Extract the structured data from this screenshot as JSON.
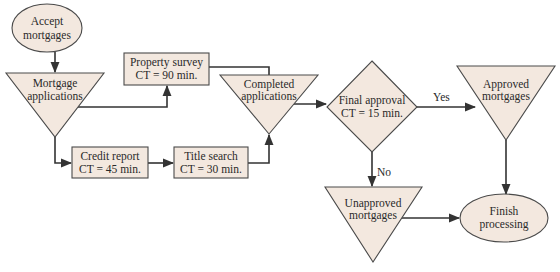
{
  "diagram": {
    "type": "process-flowchart",
    "colors": {
      "node_fill": "#f3e8df",
      "node_stroke": "#4a4a4a",
      "edge": "#333333"
    },
    "nodes": {
      "accept": {
        "shape": "ellipse",
        "line1": "Accept",
        "line2": "mortgages"
      },
      "mortgage_apps": {
        "shape": "inventory-triangle",
        "line1": "Mortgage",
        "line2": "applications"
      },
      "property_survey": {
        "shape": "process-box",
        "line1": "Property survey",
        "line2": "CT = 90 min."
      },
      "credit_report": {
        "shape": "process-box",
        "line1": "Credit report",
        "line2": "CT = 45 min."
      },
      "title_search": {
        "shape": "process-box",
        "line1": "Title search",
        "line2": "CT = 30 min."
      },
      "completed_apps": {
        "shape": "inventory-triangle",
        "line1": "Completed",
        "line2": "applications"
      },
      "final_approval": {
        "shape": "decision-diamond",
        "line1": "Final approval",
        "line2": "CT = 15 min."
      },
      "approved": {
        "shape": "inventory-triangle",
        "line1": "Approved",
        "line2": "mortgages"
      },
      "unapproved": {
        "shape": "inventory-triangle",
        "line1": "Unapproved",
        "line2": "mortgages"
      },
      "finish": {
        "shape": "ellipse",
        "line1": "Finish",
        "line2": "processing"
      }
    },
    "edges": [
      {
        "from": "accept",
        "to": "mortgage_apps",
        "label": ""
      },
      {
        "from": "mortgage_apps",
        "to": "property_survey",
        "label": ""
      },
      {
        "from": "mortgage_apps",
        "to": "credit_report",
        "label": ""
      },
      {
        "from": "credit_report",
        "to": "title_search",
        "label": ""
      },
      {
        "from": "title_search",
        "to": "completed_apps",
        "label": ""
      },
      {
        "from": "property_survey",
        "to": "completed_apps",
        "label": ""
      },
      {
        "from": "completed_apps",
        "to": "final_approval",
        "label": ""
      },
      {
        "from": "final_approval",
        "to": "approved",
        "label": "Yes"
      },
      {
        "from": "final_approval",
        "to": "unapproved",
        "label": "No"
      },
      {
        "from": "approved",
        "to": "finish",
        "label": ""
      },
      {
        "from": "unapproved",
        "to": "finish",
        "label": ""
      }
    ],
    "edge_labels": {
      "yes": "Yes",
      "no": "No"
    }
  }
}
